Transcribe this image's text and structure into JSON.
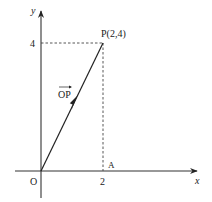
{
  "diagram": {
    "type": "coordinate-vector",
    "axes": {
      "x_label": "x",
      "y_label": "y",
      "origin_label": "O"
    },
    "ticks": {
      "x_tick": "2",
      "y_tick": "4"
    },
    "points": {
      "P_label": "P(2,4)",
      "A_label": "A"
    },
    "vector": {
      "label": "OP",
      "from": [
        0,
        0
      ],
      "to": [
        2,
        4
      ]
    },
    "colors": {
      "stroke": "#222222",
      "background": "#ffffff"
    }
  }
}
